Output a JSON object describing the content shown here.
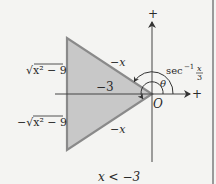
{
  "figure": {
    "axes": {
      "x_axis_label": "+",
      "y_axis_label": "+",
      "origin_label": "O"
    },
    "triangle": {
      "fill_color": "#c8c8c8",
      "stroke_color": "#8a8a8a",
      "vertices_px": [
        [
          67,
          38
        ],
        [
          67,
          150
        ],
        [
          152,
          94
        ]
      ],
      "labels": {
        "upper_hypotenuse": "−x",
        "lower_hypotenuse": "−x",
        "adjacent_side": "−3",
        "upper_height": "√x² − 9",
        "lower_height": "−√x² − 9"
      }
    },
    "angles": {
      "theta_label": "θ",
      "arc_label_prefix": "sec",
      "arc_label_exponent": "−1",
      "arc_label_fraction_num": "x",
      "arc_label_fraction_den": "3"
    },
    "caption": "x < −3"
  }
}
